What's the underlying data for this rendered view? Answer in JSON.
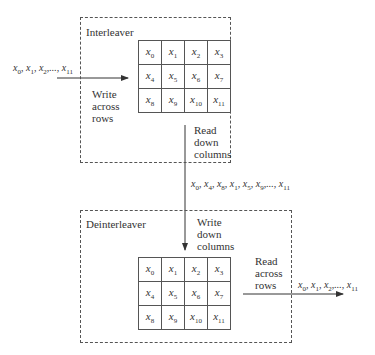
{
  "interleaver": {
    "title": "Interleaver",
    "input_sequence": [
      "x0",
      "x1",
      "x2",
      "...",
      "x11"
    ],
    "write_label": [
      "Write",
      "across",
      "rows"
    ],
    "read_label": [
      "Read",
      "down",
      "columns"
    ],
    "grid": [
      [
        "x",
        "0",
        "x",
        "1",
        "x",
        "2",
        "x",
        "3"
      ],
      [
        "x",
        "4",
        "x",
        "5",
        "x",
        "6",
        "x",
        "7"
      ],
      [
        "x",
        "8",
        "x",
        "9",
        "x",
        "10",
        "x",
        "11"
      ]
    ]
  },
  "interleaved_sequence": [
    "x0",
    "x4",
    "x8",
    "x1",
    "x5",
    "x9",
    "...",
    "x11"
  ],
  "deinterleaver": {
    "title": "Deinterleaver",
    "write_label": [
      "Write",
      "down",
      "columns"
    ],
    "read_label": [
      "Read",
      "across",
      "rows"
    ],
    "output_sequence": [
      "x0",
      "x1",
      "x2",
      "...",
      "x11"
    ],
    "grid": [
      [
        "x",
        "0",
        "x",
        "1",
        "x",
        "2",
        "x",
        "3"
      ],
      [
        "x",
        "4",
        "x",
        "5",
        "x",
        "6",
        "x",
        "7"
      ],
      [
        "x",
        "8",
        "x",
        "9",
        "x",
        "10",
        "x",
        "11"
      ]
    ]
  },
  "cells": {
    "r0": [
      "0",
      "1",
      "2",
      "3"
    ],
    "r1": [
      "4",
      "5",
      "6",
      "7"
    ],
    "r2": [
      "8",
      "9",
      "10",
      "11"
    ]
  }
}
